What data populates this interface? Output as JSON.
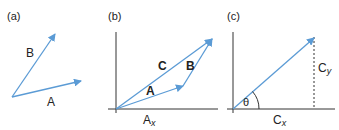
{
  "colors": {
    "vector": "#5b9bd5",
    "axis": "#333333",
    "text": "#222222"
  },
  "panels": [
    {
      "id": "a",
      "label": "(a)",
      "vectors": [
        {
          "name": "A",
          "label": "A"
        },
        {
          "name": "B",
          "label": "B"
        }
      ]
    },
    {
      "id": "b",
      "label": "(b)",
      "vectors": [
        {
          "name": "A",
          "label": "A"
        },
        {
          "name": "B",
          "label": "B"
        },
        {
          "name": "C",
          "label": "C"
        }
      ],
      "component_label": {
        "main": "A",
        "sub": "x"
      }
    },
    {
      "id": "c",
      "label": "(c)",
      "vectors": [
        {
          "name": "C"
        }
      ],
      "angle_label": "θ",
      "x_component": {
        "main": "C",
        "sub": "x"
      },
      "y_component": {
        "main": "C",
        "sub": "y"
      }
    }
  ]
}
